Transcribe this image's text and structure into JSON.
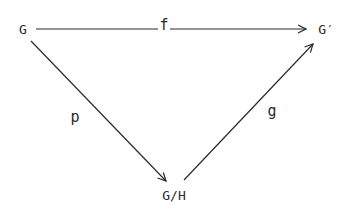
{
  "diagram": {
    "type": "commutative-diagram",
    "nodes": [
      {
        "id": "G",
        "label": "G"
      },
      {
        "id": "Gp",
        "label": "G′"
      },
      {
        "id": "GH",
        "label": "G/H"
      }
    ],
    "edges": [
      {
        "from": "G",
        "to": "Gp",
        "label": "f"
      },
      {
        "from": "G",
        "to": "GH",
        "label": "p"
      },
      {
        "from": "GH",
        "to": "Gp",
        "label": "g"
      }
    ],
    "line_color": "#2a2a2a",
    "background": "#ffffff"
  }
}
